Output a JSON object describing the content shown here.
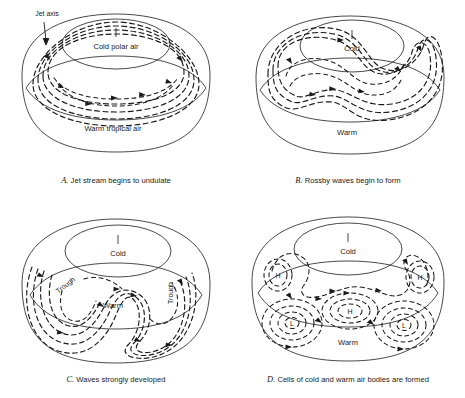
{
  "figure": {
    "background_color": "#ffffff",
    "line_color": "#1a1a1a"
  },
  "panels": [
    {
      "id": "A",
      "letter": "A.",
      "caption": "Jet stream begins to undulate",
      "caption_full": "A. Jet stream begins to undulate",
      "labels": {
        "cold": "Cold polar air",
        "warm": "Warm tropical air",
        "jet_axis": "Jet axis",
        "pole_tick": "|"
      },
      "annotations": [
        "Jet axis"
      ],
      "wave_count": 0,
      "description": "Nearly circular polar vortex with gently undulating jet"
    },
    {
      "id": "B",
      "letter": "B.",
      "caption": "Rossby waves begin to form",
      "caption_full": "B. Rossby waves begin to form",
      "labels": {
        "cold": "Cold",
        "warm": "Warm",
        "pole_tick": "|"
      },
      "annotations": [],
      "wave_count": 1,
      "description": "Jet develops a pronounced meander; Rossby waves appear"
    },
    {
      "id": "C",
      "letter": "C.",
      "caption": "Waves strongly developed",
      "caption_full": "C. Waves strongly developed",
      "labels": {
        "cold": "Cold",
        "warm": "Warm",
        "trough_left": "Trough",
        "trough_right": "Trough",
        "pole_tick": "|"
      },
      "annotations": [
        "Trough",
        "Trough"
      ],
      "wave_count": 2,
      "description": "Deep troughs of cold air extend far toward the equator"
    },
    {
      "id": "D",
      "letter": "D.",
      "caption": "Cells of cold and warm air bodies are formed",
      "caption_full": "D. Cells of cold and warm air bodies are formed",
      "labels": {
        "cold": "Cold",
        "warm": "Warm",
        "pole_tick": "|"
      },
      "pressure_cells": [
        {
          "type": "H",
          "label": "H",
          "position": "upper-left"
        },
        {
          "type": "H",
          "label": "H",
          "position": "upper-right"
        },
        {
          "type": "H",
          "label": "H",
          "position": "center"
        },
        {
          "type": "L",
          "label": "L",
          "position": "lower-left"
        },
        {
          "type": "L",
          "label": "L",
          "position": "lower-right"
        }
      ],
      "annotations": [
        "H",
        "H",
        "H",
        "L",
        "L"
      ],
      "wave_count": 3,
      "description": "Waves pinch off into closed cells of cold (L) and warm (H) air"
    }
  ]
}
